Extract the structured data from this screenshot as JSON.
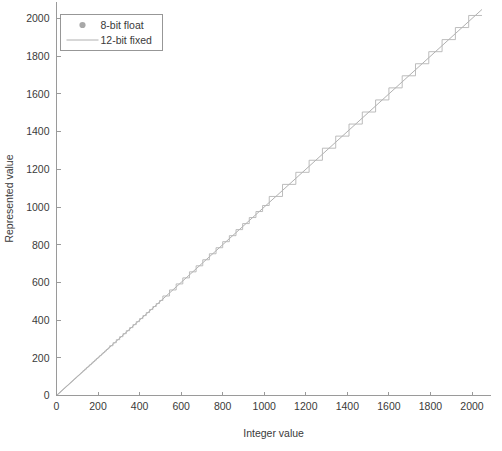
{
  "figure": {
    "background": "#ffffff",
    "axis_color": "#9a9a9a",
    "text_color": "#3a3a3a"
  },
  "chart_data": {
    "type": "line",
    "title": "",
    "xlabel": "Integer value",
    "ylabel": "Represented value",
    "xlim": [
      0,
      2090
    ],
    "ylim": [
      0,
      2090
    ],
    "xticks": [
      0,
      200,
      400,
      600,
      800,
      1000,
      1200,
      1400,
      1600,
      1800,
      2000
    ],
    "xticklabels": [
      "0",
      "200",
      "400",
      "600",
      "800",
      "1000",
      "1200",
      "1400",
      "1600",
      "1800",
      "2000"
    ],
    "yticks": [
      0,
      200,
      400,
      600,
      800,
      1000,
      1200,
      1400,
      1600,
      1800,
      2000
    ],
    "yticklabels": [
      "0",
      "200",
      "400",
      "600",
      "800",
      "1000",
      "1200",
      "1400",
      "1600",
      "1800",
      "2000"
    ],
    "grid": false,
    "legend_position": "upper left",
    "series": [
      {
        "name": "8-bit float",
        "style": "stepped-marker",
        "color": "#b4b4b4",
        "marker": "circle",
        "description": "Quantized representation: piecewise-constant plateaus whose width doubles each binade (mantissa of 4 bits => 16 steps per octave), tracking y = x on average.",
        "mantissa_bits": 4,
        "quantization_segments": [
          {
            "x_start": 0,
            "x_end": 16,
            "step": 1
          },
          {
            "x_start": 16,
            "x_end": 32,
            "step": 1
          },
          {
            "x_start": 32,
            "x_end": 64,
            "step": 2
          },
          {
            "x_start": 64,
            "x_end": 128,
            "step": 4
          },
          {
            "x_start": 128,
            "x_end": 256,
            "step": 8
          },
          {
            "x_start": 256,
            "x_end": 512,
            "step": 16
          },
          {
            "x_start": 512,
            "x_end": 1024,
            "step": 32
          },
          {
            "x_start": 1024,
            "x_end": 2048,
            "step": 64
          }
        ]
      },
      {
        "name": "12-bit fixed",
        "style": "line",
        "color": "#a7a7a7",
        "description": "Ideal linear reference, y = x across the full 0..2048 range.",
        "x": [
          0,
          2048
        ],
        "values": [
          0,
          2048
        ]
      }
    ],
    "annotations": []
  },
  "legend": {
    "entries": [
      {
        "label": "8-bit float",
        "symbol": "marker-dot"
      },
      {
        "label": "12-bit fixed",
        "symbol": "line-sample"
      }
    ]
  }
}
